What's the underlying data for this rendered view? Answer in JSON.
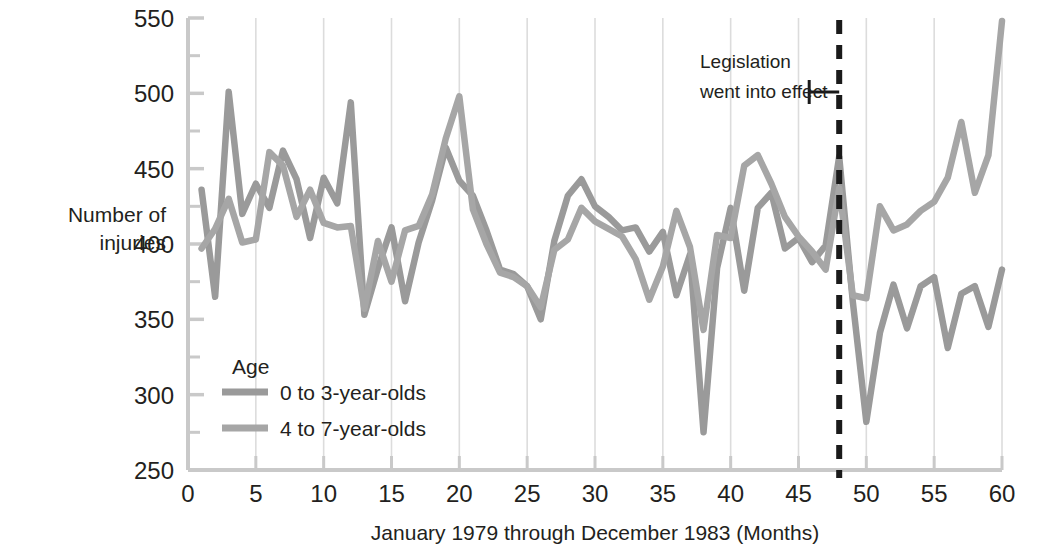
{
  "chart_data": {
    "type": "line",
    "title": "",
    "xlabel": "January 1979 through December 1983 (Months)",
    "ylabel": "Number of\ninjuries",
    "ylabel_line1": "Number of",
    "ylabel_line2": "injuries",
    "xlim": [
      0,
      60
    ],
    "ylim": [
      250,
      550
    ],
    "xticks": [
      0,
      5,
      10,
      15,
      20,
      25,
      30,
      35,
      40,
      45,
      50,
      55,
      60
    ],
    "xtick_labels": [
      "0",
      "5",
      "10",
      "15",
      "20",
      "25",
      "30",
      "35",
      "40",
      "45",
      "50",
      "55",
      "60"
    ],
    "yticks": [
      250,
      300,
      350,
      400,
      450,
      500,
      550
    ],
    "ytick_labels": [
      "250",
      "300",
      "350",
      "400",
      "450",
      "500",
      "550"
    ],
    "y_minor_ticks": [
      275,
      325,
      375,
      425,
      475,
      525
    ],
    "grid": "vertical-major-only",
    "legend_position": "inside-lower-left",
    "legend_title": "Age",
    "line_color": "#9a9a9a",
    "line_color_secondary": "#a6a6a6",
    "axis_color": "#c9c9c9",
    "grid_color": "#dcdcdc",
    "annotation_color": "#1a1a1a",
    "x": [
      1,
      2,
      3,
      4,
      5,
      6,
      7,
      8,
      9,
      10,
      11,
      12,
      13,
      14,
      15,
      16,
      17,
      18,
      19,
      20,
      21,
      22,
      23,
      24,
      25,
      26,
      27,
      28,
      29,
      30,
      31,
      32,
      33,
      34,
      35,
      36,
      37,
      38,
      39,
      40,
      41,
      42,
      43,
      44,
      45,
      46,
      47,
      48,
      49,
      50,
      51,
      52,
      53,
      54,
      55,
      56,
      57,
      58,
      59,
      60
    ],
    "series": [
      {
        "name": "0 to 3-year-olds",
        "values": [
          436,
          365,
          501,
          420,
          440,
          424,
          462,
          443,
          404,
          444,
          427,
          494,
          353,
          384,
          411,
          362,
          401,
          429,
          464,
          442,
          432,
          409,
          383,
          380,
          372,
          350,
          402,
          432,
          443,
          425,
          418,
          409,
          411,
          395,
          408,
          366,
          393,
          275,
          384,
          424,
          369,
          424,
          434,
          397,
          404,
          388,
          399,
          458,
          362,
          282,
          341,
          373,
          344,
          372,
          378,
          331,
          367,
          372,
          345,
          383
        ]
      },
      {
        "name": "4 to 7-year-olds",
        "values": [
          397,
          410,
          430,
          401,
          403,
          461,
          452,
          418,
          436,
          414,
          411,
          412,
          357,
          402,
          375,
          409,
          412,
          433,
          470,
          498,
          423,
          400,
          381,
          378,
          372,
          358,
          396,
          403,
          424,
          415,
          410,
          405,
          390,
          363,
          385,
          422,
          398,
          343,
          406,
          404,
          452,
          459,
          440,
          418,
          405,
          395,
          383,
          437,
          366,
          364,
          425,
          409,
          413,
          422,
          428,
          444,
          481,
          434,
          459,
          548
        ]
      }
    ],
    "annotation": {
      "line1": "Legislation",
      "line2": "went into effect",
      "vline_x": 48,
      "style": "dashed-vertical"
    }
  }
}
